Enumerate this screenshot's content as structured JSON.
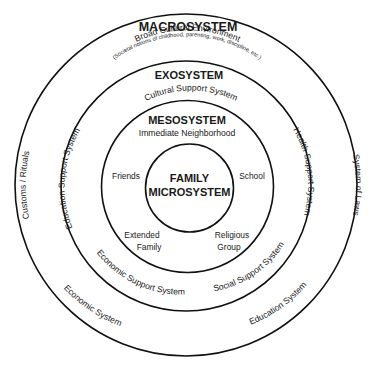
{
  "diagram": {
    "colors": {
      "stroke": "#111111",
      "text": "#1a1a1a",
      "background": "#ffffff"
    },
    "macrosystem": {
      "title": "MACROSYSTEM",
      "subtitle": "Broad Cultural Environment",
      "note": "(Societal notions of childhood, parenting, work, discipline, etc.)",
      "left_label": "Customs / Rituals",
      "right_label": "System of Laws",
      "bottom_left_label": "Economic System",
      "bottom_right_label": "Education System"
    },
    "exosystem": {
      "title": "EXOSYSTEM",
      "top_label": "Cultural Support System",
      "left_label": "Education Support System",
      "right_label": "Health Support System",
      "bottom_left_label": "Economic Support System",
      "bottom_right_label": "Social Support System"
    },
    "mesosystem": {
      "title": "MESOSYSTEM",
      "subtitle": "Immediate Neighborhood",
      "items": {
        "friends": "Friends",
        "school": "School",
        "extended_family_1": "Extended",
        "extended_family_2": "Family",
        "religious_group_1": "Religious",
        "religious_group_2": "Group"
      }
    },
    "microsystem": {
      "title_line1": "FAMILY",
      "title_line2": "MICROSYSTEM"
    }
  }
}
